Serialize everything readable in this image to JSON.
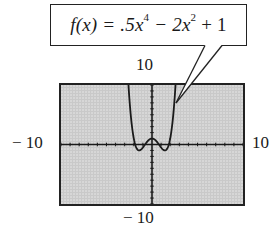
{
  "callout": {
    "prefix": "f(x) = .5x",
    "exp1": "4",
    "middle": " − 2x",
    "exp2": "2",
    "suffix": " + 1"
  },
  "window_labels": {
    "ymax": "10",
    "xmin": "− 10",
    "xmax": "10",
    "ymin": "− 10"
  },
  "colors": {
    "screen": "#c9c9c9",
    "ink": "#222222"
  },
  "chart_data": {
    "type": "line",
    "function": ".5x^4 - 2x^2 + 1",
    "xlabel": "",
    "ylabel": "",
    "xlim": [
      -10,
      10
    ],
    "ylim": [
      -10,
      10
    ],
    "xscl": 1,
    "yscl": 1,
    "grid": false,
    "series": [
      {
        "name": "f(x)",
        "x": [
          -2.4,
          -2.2,
          -2.0,
          -1.8,
          -1.6,
          -1.414,
          -1.2,
          -1.0,
          -0.8,
          -0.6,
          -0.4,
          -0.2,
          0,
          0.2,
          0.4,
          0.6,
          0.8,
          1.0,
          1.2,
          1.414,
          1.6,
          1.8,
          2.0,
          2.2,
          2.4
        ],
        "values": [
          5.07,
          2.64,
          1.0,
          -0.23,
          -0.84,
          -1.0,
          -0.84,
          -0.5,
          -0.08,
          0.34,
          0.69,
          0.92,
          1.0,
          0.92,
          0.69,
          0.34,
          -0.08,
          -0.5,
          -0.84,
          -1.0,
          -0.84,
          -0.23,
          1.0,
          2.64,
          5.07
        ]
      }
    ],
    "key_points": {
      "local_max": [
        0,
        1
      ],
      "local_min": [
        [
          -1.414,
          -1
        ],
        [
          1.414,
          -1
        ]
      ]
    }
  }
}
